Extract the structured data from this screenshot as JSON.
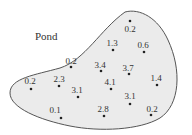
{
  "diagram": {
    "title": "Pond",
    "fill_color": "#ebebeb",
    "outline_color": "#555555",
    "measurements": [
      {
        "value": "0.2",
        "x": 130,
        "y": 21,
        "lx": 130,
        "ly": 32
      },
      {
        "value": "1.3",
        "x": 113,
        "y": 50,
        "lx": 112,
        "ly": 46
      },
      {
        "value": "0.6",
        "x": 144,
        "y": 52,
        "lx": 143,
        "ly": 48
      },
      {
        "value": "0.2",
        "x": 71,
        "y": 67,
        "lx": 71,
        "ly": 64
      },
      {
        "value": "3.4",
        "x": 101,
        "y": 71,
        "lx": 100,
        "ly": 68
      },
      {
        "value": "3.7",
        "x": 129,
        "y": 74,
        "lx": 128,
        "ly": 71
      },
      {
        "value": "0.2",
        "x": 31,
        "y": 89,
        "lx": 30,
        "ly": 84
      },
      {
        "value": "2.3",
        "x": 59,
        "y": 86,
        "lx": 59,
        "ly": 82
      },
      {
        "value": "3.1",
        "x": 78,
        "y": 97,
        "lx": 77,
        "ly": 93
      },
      {
        "value": "4.1",
        "x": 111,
        "y": 89,
        "lx": 110,
        "ly": 85
      },
      {
        "value": "1.4",
        "x": 157,
        "y": 85,
        "lx": 156,
        "ly": 81
      },
      {
        "value": "3.1",
        "x": 130,
        "y": 104,
        "lx": 130,
        "ly": 99
      },
      {
        "value": "0.1",
        "x": 61,
        "y": 118,
        "lx": 55,
        "ly": 113
      },
      {
        "value": "2.8",
        "x": 104,
        "y": 116,
        "lx": 103,
        "ly": 112
      },
      {
        "value": "0.2",
        "x": 151,
        "y": 115,
        "lx": 152,
        "ly": 112
      }
    ]
  }
}
